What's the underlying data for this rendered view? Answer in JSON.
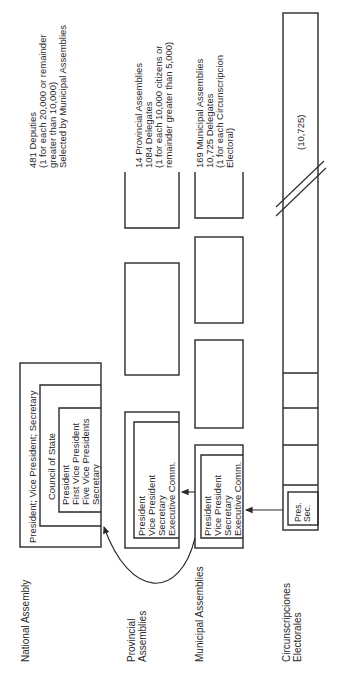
{
  "levels": {
    "national": {
      "label": "National Assembly",
      "outer_box": "President; Vice President; Secretary",
      "council_label": "Council of State",
      "council_members": "President\nFirst Vice President\nFive Vice Presidents\nSecretary",
      "description": "481 Deputies\n(1 for each 20,000 or remainder\ngreater than 10,000)\nSelected by Municipal Assemblies"
    },
    "provincial": {
      "label": "Provincial\nAssemblies",
      "members": "President\nVice President\nSecretary\nExecutive Comm.",
      "description": "14 Provincial Assemblies\n1084 Delegates\n(1 for each 10,000 citizens or\nremainder greater than 5,000)"
    },
    "municipal": {
      "label": "Municipal Assemblies",
      "members": "President\nVice President\nSecretary\nExecutive Comm.",
      "description": "169 Municipal Assemblies\n10,725 Delegates\n(1 for each Circunscripcion\nElectoral)"
    },
    "circunscripciones": {
      "label": "Circunscripciones\nElectorales",
      "members": "Pres.\nSec.",
      "count": "(10,725)"
    }
  },
  "colors": {
    "line": "#2a2a2a",
    "background": "#ffffff"
  }
}
